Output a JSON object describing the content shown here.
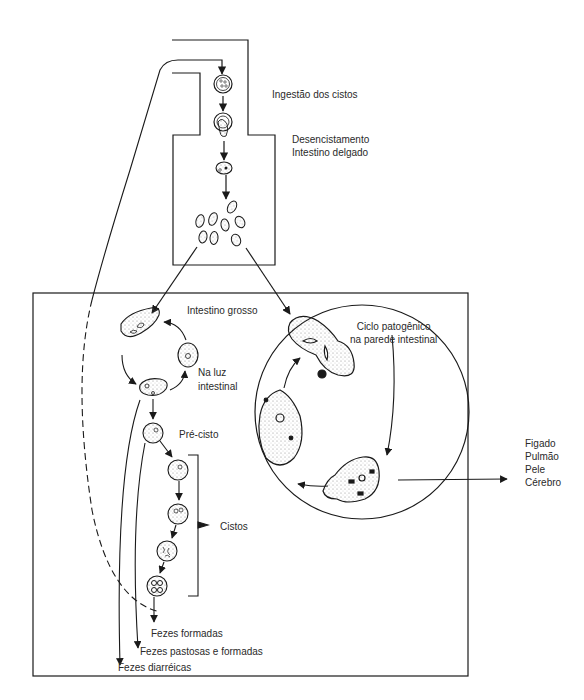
{
  "diagram": {
    "title": "",
    "labels": {
      "ingestao": "Ingestão dos cistos",
      "desencistamento": "Desencistamento",
      "intestino_delgado": "Intestino delgado",
      "intestino_grosso": "Intestino grosso",
      "na_luz": "Na luz",
      "intestinal": "intestinal",
      "pre_cisto": "Pré-cisto",
      "cistos": "Cistos",
      "ciclo_patogenico": "Ciclo patogênico",
      "na_parede": "na parede intestinal",
      "fezes_formadas": "Fezes formadas",
      "fezes_pastosas": "Fezes pastosas e formadas",
      "fezes_diarreicas": "Fezes diarréicas"
    },
    "organs": [
      "Figado",
      "Pulmão",
      "Pele",
      "Cérebro"
    ],
    "colors": {
      "line": "#1a1a1a",
      "stipple": "#6a6a6a",
      "background": "#ffffff"
    }
  }
}
